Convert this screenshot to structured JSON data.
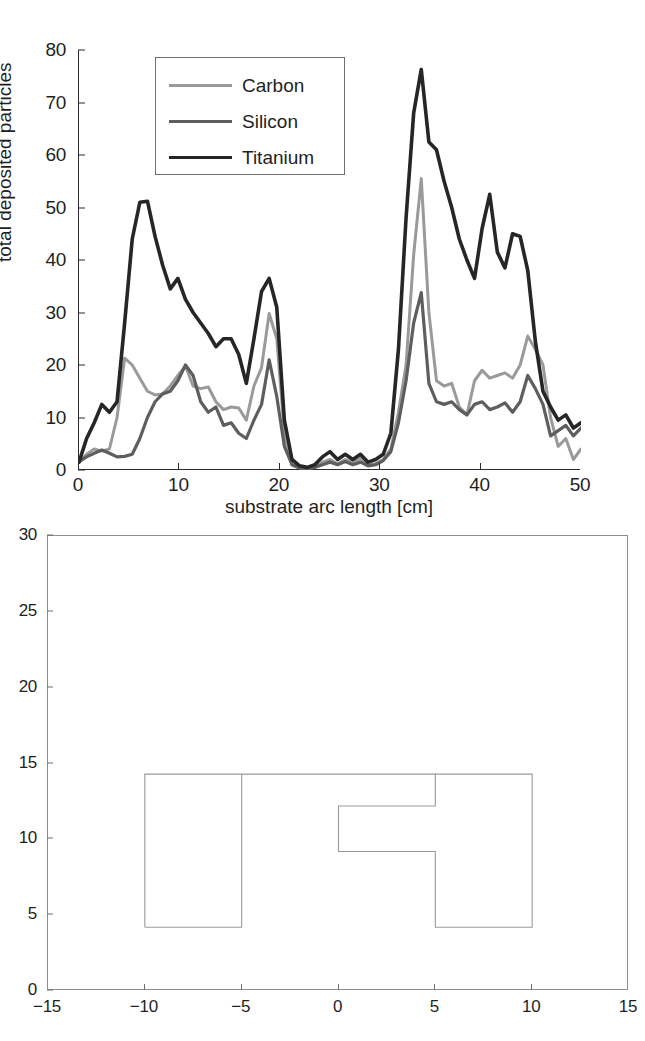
{
  "figure": {
    "panels": [
      "deposition-profile-chart",
      "substrate-geometry-chart"
    ]
  },
  "chart_data": [
    {
      "type": "line",
      "title": "",
      "xlabel": "substrate arc length [cm]",
      "ylabel": "total deposited particles",
      "xlim": [
        0,
        50
      ],
      "ylim": [
        0,
        80
      ],
      "xticks": [
        0,
        10,
        20,
        30,
        40,
        50
      ],
      "yticks": [
        0,
        10,
        20,
        30,
        40,
        50,
        60,
        70,
        80
      ],
      "grid": false,
      "legend_position": "upper-left-inside",
      "legend": [
        "Carbon",
        "Silicon",
        "Titanium"
      ],
      "colors": {
        "Carbon": "#9a9a9a",
        "Silicon": "#5e5e5e",
        "Titanium": "#262626"
      },
      "x": [
        0,
        1,
        2,
        3,
        4,
        5,
        6,
        7,
        8,
        9,
        10,
        11,
        12,
        13,
        14,
        15,
        16,
        17,
        18,
        19,
        20,
        21,
        22,
        23,
        24,
        25,
        26,
        27,
        28,
        29,
        30,
        31,
        32,
        33,
        34,
        35,
        36,
        37,
        38,
        39,
        40,
        41,
        42,
        43,
        44,
        45,
        46,
        47,
        48,
        49,
        50
      ],
      "series": [
        {
          "name": "Carbon",
          "values": [
            1.5,
            3.0,
            4.0,
            3.6,
            4.0,
            10.0,
            21.3,
            20.0,
            17.5,
            15.0,
            14.3,
            14.5,
            16.0,
            18.0,
            19.8,
            16.0,
            15.5,
            15.8,
            13.0,
            11.5,
            12.0,
            11.8,
            9.5,
            16.0,
            19.5,
            29.8,
            25.0,
            7.0,
            1.0,
            0.4,
            0.3,
            0.5,
            1.5,
            2.0,
            1.2,
            2.0,
            1.5,
            2.2,
            1.0,
            1.2,
            2.0,
            4.0,
            11.0,
            20.0,
            41.0,
            55.5,
            30.0,
            17.0,
            16.0,
            16.5,
            12.0,
            10.5,
            17.0,
            19.0,
            17.5,
            18.0,
            18.5,
            17.5,
            20.0,
            25.5,
            23.0,
            20.0,
            10.0,
            4.5,
            6.0,
            2.0,
            4.0
          ]
        },
        {
          "name": "Silicon",
          "values": [
            1.6,
            2.5,
            3.2,
            3.8,
            3.2,
            2.5,
            2.6,
            3.0,
            6.0,
            10.0,
            13.0,
            14.5,
            15.0,
            17.0,
            20.0,
            18.0,
            13.0,
            11.0,
            12.0,
            8.5,
            9.0,
            7.0,
            6.0,
            9.5,
            12.5,
            21.0,
            14.0,
            4.5,
            1.0,
            0.4,
            0.3,
            0.5,
            1.0,
            1.5,
            1.0,
            1.6,
            1.0,
            1.5,
            0.8,
            1.0,
            1.8,
            3.5,
            9.0,
            17.0,
            28.0,
            33.8,
            16.5,
            13.0,
            12.5,
            13.0,
            11.5,
            10.5,
            12.5,
            13.0,
            11.5,
            12.0,
            12.8,
            11.0,
            13.0,
            18.0,
            15.5,
            12.5,
            6.5,
            7.5,
            8.5,
            6.5,
            8.0
          ]
        },
        {
          "name": "Titanium",
          "values": [
            1.5,
            6.0,
            9.0,
            12.5,
            11.0,
            13.0,
            28.0,
            44.0,
            51.0,
            51.2,
            44.5,
            39.0,
            34.5,
            36.5,
            32.5,
            30.0,
            28.0,
            26.0,
            23.5,
            25.0,
            25.0,
            22.0,
            16.5,
            25.0,
            34.0,
            36.5,
            31.0,
            9.5,
            2.0,
            0.8,
            0.5,
            1.0,
            2.5,
            3.5,
            2.0,
            3.0,
            2.0,
            3.0,
            1.5,
            2.0,
            3.0,
            7.0,
            23.0,
            48.0,
            68.0,
            76.3,
            62.5,
            61.0,
            55.0,
            50.0,
            44.0,
            40.0,
            36.5,
            46.0,
            52.5,
            41.5,
            38.5,
            45.0,
            44.5,
            38.0,
            24.5,
            15.0,
            12.0,
            9.5,
            10.5,
            8.0,
            9.0
          ]
        }
      ]
    },
    {
      "type": "line",
      "title": "",
      "xlabel": "",
      "ylabel": "",
      "xlim": [
        -15,
        15
      ],
      "ylim": [
        0,
        30
      ],
      "xticks": [
        -15,
        -10,
        -5,
        0,
        5,
        10,
        15
      ],
      "yticks": [
        0,
        5,
        10,
        15,
        20,
        25,
        30
      ],
      "grid": false,
      "legend": [],
      "shape_name": "substrate-cross-section",
      "shape_color": "#9a9a9a",
      "shape_vertices": [
        [
          -10.0,
          4.2
        ],
        [
          -10.0,
          14.3
        ],
        [
          10.0,
          14.3
        ],
        [
          10.0,
          4.2
        ],
        [
          5.0,
          4.2
        ],
        [
          5.0,
          9.2
        ],
        [
          0.0,
          9.2
        ],
        [
          0.0,
          12.2
        ],
        [
          5.0,
          12.2
        ],
        [
          5.0,
          14.3
        ],
        [
          -5.0,
          14.3
        ],
        [
          -5.0,
          4.2
        ],
        [
          -10.0,
          4.2
        ]
      ]
    }
  ],
  "top_panel": {
    "ylabel": "total deposited particles",
    "xlabel": "substrate arc length [cm]",
    "yticks": [
      "0",
      "10",
      "20",
      "30",
      "40",
      "50",
      "60",
      "70",
      "80"
    ],
    "xticks": [
      "0",
      "10",
      "20",
      "30",
      "40",
      "50"
    ],
    "legend": [
      {
        "label": "Carbon",
        "color": "#9a9a9a",
        "width": 3.0
      },
      {
        "label": "Silicon",
        "color": "#5e5e5e",
        "width": 3.2
      },
      {
        "label": "Titanium",
        "color": "#262626",
        "width": 3.6
      }
    ]
  },
  "bottom_panel": {
    "yticks": [
      "0",
      "5",
      "10",
      "15",
      "20",
      "25",
      "30"
    ],
    "xticks": [
      "-15",
      "-10",
      "-5",
      "0",
      "5",
      "10",
      "15"
    ]
  }
}
